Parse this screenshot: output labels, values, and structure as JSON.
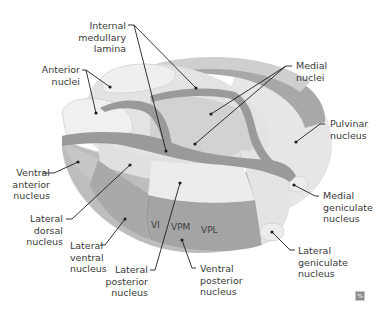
{
  "diagram": {
    "colors": {
      "light": "#ececec",
      "mid": "#d6d6d6",
      "lamina": "#9b9b9b",
      "dark": "#a9a9a9",
      "outline": "#cfcfcf",
      "line": "#1e1e1e"
    },
    "labels": {
      "internal_medullary_lamina": [
        "Internal",
        "medullary",
        "lamina"
      ],
      "anterior_nuclei": [
        "Anterior",
        "nuclei"
      ],
      "medial_nuclei": [
        "Medial",
        "nuclei"
      ],
      "pulvinar_nucleus": [
        "Pulvinar",
        "nucleus"
      ],
      "ventral_anterior_nucleus": [
        "Ventral",
        "anterior",
        "nucleus"
      ],
      "medial_geniculate_nucleus": [
        "Medial",
        "geniculate",
        "nucleus"
      ],
      "lateral_dorsal_nucleus": [
        "Lateral",
        "dorsal",
        "nucleus"
      ],
      "lateral_ventral_nucleus": [
        "Lateral",
        "ventral",
        "nucleus"
      ],
      "lateral_posterior_nucleus": [
        "Lateral",
        "posterior",
        "nucleus"
      ],
      "ventral_posterior_nucleus": [
        "Ventral",
        "posterior",
        "nucleus"
      ],
      "lateral_geniculate_nucleus": [
        "Lateral",
        "geniculate",
        "nucleus"
      ]
    },
    "regions": {
      "vl": "Vl",
      "vpm": "VPM",
      "vpl": "VPL"
    },
    "badge": "%"
  }
}
